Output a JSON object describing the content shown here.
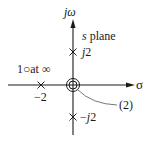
{
  "diagram": {
    "type": "pole-zero plot",
    "plane_label": {
      "var": "s",
      "rest": " plane"
    },
    "axes": {
      "vertical_label": {
        "j": "j",
        "omega": "ω"
      },
      "horizontal_label": "σ"
    },
    "poles": [
      {
        "id": "pole-j2",
        "real": 0,
        "imag": 2,
        "label_j": "j",
        "label_num": "2",
        "label_sign": ""
      },
      {
        "id": "pole-minus-j2",
        "real": 0,
        "imag": -2,
        "label_j": "j",
        "label_num": "2",
        "label_sign": "−"
      },
      {
        "id": "pole-minus-2",
        "real": -2,
        "imag": 0,
        "label": "−2"
      }
    ],
    "zeros": [
      {
        "id": "double-zero-origin",
        "real": 0,
        "imag": 0,
        "multiplicity": 2,
        "label": "(2)"
      },
      {
        "id": "zero-at-infinity",
        "count": 1,
        "label_num": "1",
        "label_symbol": "○",
        "label_text": "at ∞"
      }
    ],
    "colors": {
      "ink": "#1a1a1a",
      "leader": "#666666",
      "background": "#ffffff"
    }
  }
}
